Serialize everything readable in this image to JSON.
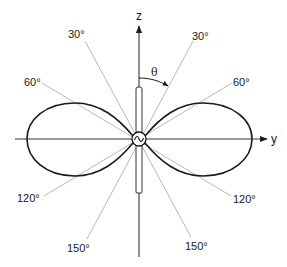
{
  "figure": {
    "type": "antenna-radiation-pattern"
  },
  "axes": {
    "z_label": "z",
    "y_label": "y",
    "angle_label": "θ"
  },
  "angle_labels": {
    "upper_left_30": "30°",
    "upper_right_30": "30°",
    "left_60": "60°",
    "right_60": "60°",
    "left_120": "120°",
    "right_120": "120°",
    "lower_left_150": "150°",
    "lower_right_150": "150°"
  },
  "source": {
    "symbol": "~"
  },
  "colors": {
    "lobe": "#1a1a1a",
    "axis": "#333333",
    "angle_line": "#b0b0b0"
  }
}
